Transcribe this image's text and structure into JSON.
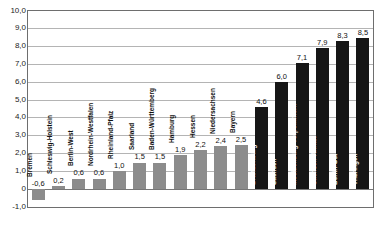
{
  "chart_data": {
    "type": "bar",
    "title": "",
    "xlabel": "",
    "ylabel": "",
    "ylim": [
      -1.0,
      10.0
    ],
    "ytick_step": 1.0,
    "ytick_labels_top_to_bottom": [
      "10,0",
      "9,0",
      "8,0",
      "7,0",
      "6,0",
      "5,0",
      "4,0",
      "3,0",
      "2,0",
      "1,0",
      "0",
      "-1,0"
    ],
    "grid": "horizontal",
    "legend": "none",
    "categories": [
      "Bremen",
      "Schleswig-Holstein",
      "Berlin-West",
      "Nordrhein-Westfalen",
      "Rheinland-Pfalz",
      "Saarland",
      "Baden-Württemberg",
      "Hamburg",
      "Hessen",
      "Niedersachsen",
      "Bayern",
      "Brandenburg",
      "Sachsen",
      "Mecklenburg-Vorpommern",
      "Sachsen-Anhalt",
      "Berlin-Ost",
      "Thüringen"
    ],
    "values": [
      -0.6,
      0.2,
      0.6,
      0.6,
      1.0,
      1.5,
      1.5,
      1.9,
      2.2,
      2.4,
      2.5,
      4.6,
      6.0,
      7.1,
      7.9,
      8.3,
      8.5
    ],
    "value_labels": [
      "-0,6",
      "0,2",
      "0,6",
      "0,6",
      "1,0",
      "1,5",
      "1,5",
      "1,9",
      "2,2",
      "2,4",
      "2,5",
      "4,6",
      "6,0",
      "7,1",
      "7,9",
      "8,3",
      "8,5"
    ],
    "groups": [
      "west",
      "west",
      "west",
      "west",
      "west",
      "west",
      "west",
      "west",
      "west",
      "west",
      "west",
      "east",
      "east",
      "east",
      "east",
      "east",
      "east"
    ],
    "colors": {
      "west_bar": "#8c8c8c",
      "east_bar": "#161616",
      "west_name_text": "#111111",
      "east_name_text": "#ffffff",
      "value_text": "#111111",
      "gridline": "#b4b4b4",
      "plot_border": "#6e6e6e",
      "background": "#ffffff"
    }
  }
}
